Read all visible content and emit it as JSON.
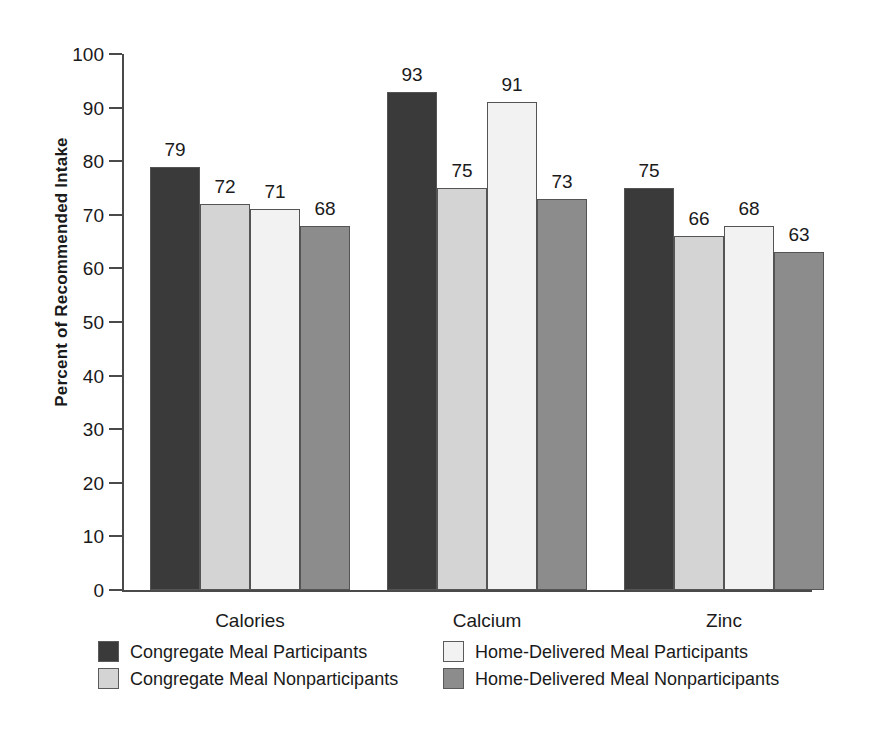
{
  "chart_data": {
    "type": "bar",
    "title": "",
    "xlabel": "",
    "ylabel": "Percent of Recommended Intake",
    "ylim": [
      0,
      100
    ],
    "ytick_step": 10,
    "yticks": [
      0,
      10,
      20,
      30,
      40,
      50,
      60,
      70,
      80,
      90,
      100
    ],
    "grid": false,
    "legend_position": "bottom",
    "categories": [
      "Calories",
      "Calcium",
      "Zinc"
    ],
    "series": [
      {
        "name": "Congregate Meal Participants",
        "color": "#3a3a3a",
        "values": [
          79,
          93,
          75
        ]
      },
      {
        "name": "Congregate Meal Nonparticipants",
        "color": "#d4d4d4",
        "values": [
          72,
          75,
          66
        ]
      },
      {
        "name": "Home-Delivered Meal Participants",
        "color": "#f2f2f2",
        "values": [
          71,
          91,
          68
        ]
      },
      {
        "name": "Home-Delivered Meal Nonparticipants",
        "color": "#8c8c8c",
        "values": [
          68,
          73,
          63
        ]
      }
    ],
    "data_labels": [
      [
        79,
        72,
        71,
        68
      ],
      [
        93,
        75,
        91,
        73
      ],
      [
        75,
        66,
        68,
        63
      ]
    ]
  },
  "axis": {
    "line_color": "#4a4a4a"
  },
  "legend": {
    "entries": [
      {
        "label": "Congregate Meal Participants",
        "color": "#3a3a3a"
      },
      {
        "label": "Home-Delivered Meal Participants",
        "color": "#f2f2f2"
      },
      {
        "label": "Congregate Meal Nonparticipants",
        "color": "#d4d4d4"
      },
      {
        "label": "Home-Delivered Meal Nonparticipants",
        "color": "#8c8c8c"
      }
    ]
  }
}
